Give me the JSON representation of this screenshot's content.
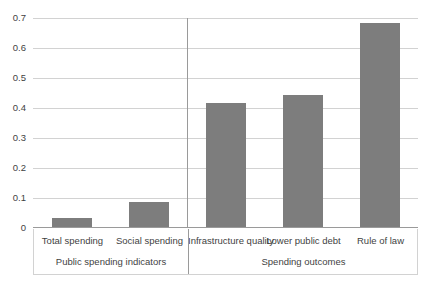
{
  "chart_data": {
    "type": "bar",
    "title": "",
    "subtitle": "",
    "xlabel": "",
    "ylabel": "",
    "categories": [
      "Total spending",
      "Social spending",
      "Infrastructure quality",
      "Lower public debt",
      "Rule of law"
    ],
    "values": [
      0.03,
      0.085,
      0.415,
      0.44,
      0.68
    ],
    "ylim": [
      0,
      0.7
    ],
    "ytick_labels": [
      "0",
      "0.1",
      "0.2",
      "0.3",
      "0.4",
      "0.5",
      "0.6",
      "0.7"
    ],
    "ytick_values": [
      0,
      0.1,
      0.2,
      0.3,
      0.4,
      0.5,
      0.6,
      0.7
    ],
    "grid": true,
    "legend": false,
    "legend_position": "none",
    "bar_color": "#7d7d7d",
    "gridline_color": "#d2d2d2",
    "axis_color": "#9a9a9a",
    "text_color": "#3f3f3f",
    "groups": [
      {
        "label": "Public spending indicators",
        "category_indices": [
          0,
          1
        ]
      },
      {
        "label": "Spending outcomes",
        "category_indices": [
          2,
          3,
          4
        ]
      }
    ],
    "annotations": []
  }
}
